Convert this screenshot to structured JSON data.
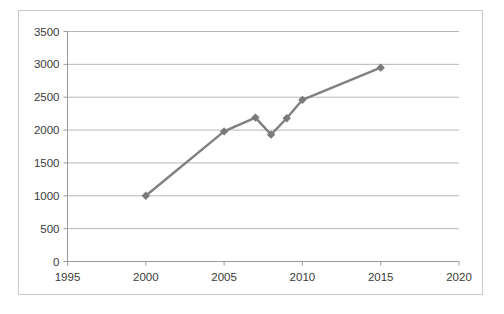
{
  "chart_data": {
    "type": "line",
    "title": "",
    "subtitle": "",
    "xlabel": "",
    "ylabel": "",
    "x": [
      2000,
      2005,
      2007,
      2008,
      2009,
      2010,
      2015
    ],
    "values": [
      1000,
      1980,
      2190,
      1930,
      2180,
      2460,
      2950
    ],
    "series": [
      {
        "name": "Series 1",
        "x": [
          2000,
          2005,
          2007,
          2008,
          2009,
          2010,
          2015
        ],
        "values": [
          1000,
          1980,
          2190,
          1930,
          2180,
          2460,
          2950
        ]
      }
    ],
    "xlim": [
      1995,
      2020
    ],
    "ylim": [
      0,
      3500
    ],
    "x_ticks": [
      1995,
      2000,
      2005,
      2010,
      2015,
      2020
    ],
    "x_tick_labels": [
      "1995",
      "2000",
      "2005",
      "2010",
      "2015",
      "2020"
    ],
    "y_ticks": [
      0,
      500,
      1000,
      1500,
      2000,
      2500,
      3000,
      3500
    ],
    "y_tick_labels": [
      "0",
      "500",
      "1000",
      "1500",
      "2000",
      "2500",
      "3000",
      "3500"
    ],
    "grid": "horizontal",
    "legend": "none",
    "marker": "diamond",
    "line_color": "#808080",
    "marker_color": "#7a7a7a",
    "grid_color": "#b7b7b7",
    "axis_color": "#9a9a9a",
    "border_color": "#c9c9c9",
    "background_color": "#ffffff",
    "text_color": "#3a3a3a"
  }
}
